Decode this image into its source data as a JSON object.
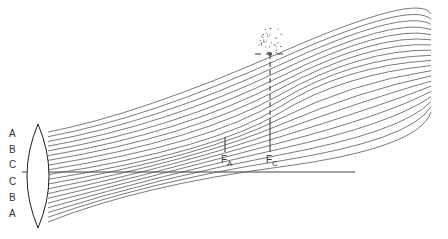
{
  "lens": {
    "cx": 38,
    "top": 124,
    "bottom": 228,
    "half_width": 11
  },
  "optical_axis": {
    "x1": 22,
    "x2": 355,
    "y": 172
  },
  "zone_labels": [
    {
      "text": "A",
      "x": 9,
      "y": 137
    },
    {
      "text": "B",
      "x": 9,
      "y": 153
    },
    {
      "text": "C",
      "x": 9,
      "y": 168
    },
    {
      "text": "C",
      "x": 9,
      "y": 185
    },
    {
      "text": "B",
      "x": 9,
      "y": 201
    },
    {
      "text": "A",
      "x": 9,
      "y": 217
    }
  ],
  "focal_points": [
    {
      "label": "F",
      "sub": "A",
      "x": 225,
      "tick_top": 137,
      "tick_bottom": 152
    },
    {
      "label": "F",
      "sub": "C",
      "x": 270,
      "tick_top": 120,
      "tick_bottom": 152
    }
  ],
  "blur_spot": {
    "x": 270,
    "y": 54,
    "dash_left": 255,
    "dash_right": 285
  },
  "rays": {
    "count": 20,
    "lens_x": 48,
    "lens_top": 132,
    "lens_bottom": 222,
    "end_x": 431,
    "end_top": 14,
    "end_bottom": 112,
    "color": "#222222"
  }
}
